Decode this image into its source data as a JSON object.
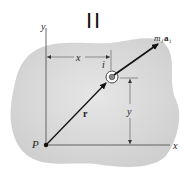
{
  "figure": {
    "title_marker": "II",
    "labels": {
      "y_axis": "y",
      "x_axis": "x",
      "origin": "P",
      "particle": "i",
      "position_vector": "r",
      "force_m": "m",
      "force_sub_m": "i",
      "force_a": "a",
      "force_sub_a": "i",
      "x_dimension": "x",
      "y_dimension": "y"
    },
    "colors": {
      "body_fill": "#d9d9d9",
      "line": "#222222",
      "axis": "#555555"
    }
  }
}
